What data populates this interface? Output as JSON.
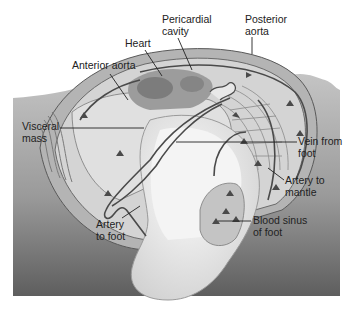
{
  "figure": {
    "colors": {
      "background": "#ffffff",
      "sediment_light": "#c8c8c8",
      "sediment_dark": "#6a6a6a",
      "shell": "#b8b8b8",
      "mantle": "#d6d6d6",
      "foot": "#eeeeee",
      "vessel": "#4a4a4a",
      "organ": "#8a8a8a",
      "label_text": "#222222"
    }
  },
  "labels": {
    "pericardial_cavity": {
      "line1": "Pericardial",
      "line2": "cavity"
    },
    "posterior_aorta": {
      "line1": "Posterior",
      "line2": "aorta"
    },
    "heart": {
      "line1": "Heart"
    },
    "anterior_aorta": {
      "line1": "Anterior aorta"
    },
    "visceral_mass": {
      "line1": "Visceral",
      "line2": "mass"
    },
    "vein_from_foot": {
      "line1": "Vein from",
      "line2": "foot"
    },
    "artery_to_mantle": {
      "line1": "Artery to",
      "line2": "mantle"
    },
    "blood_sinus_of_foot": {
      "line1": "Blood sinus",
      "line2": "of foot"
    },
    "artery_to_foot": {
      "line1": "Artery",
      "line2": "to foot"
    }
  }
}
